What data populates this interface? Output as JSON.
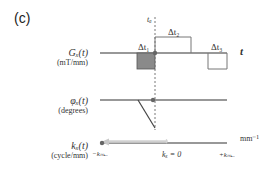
{
  "panel": {
    "label": "(c)"
  },
  "rows": {
    "gradient": {
      "label": "Gₓ(t)",
      "unit": "(mT/mm)"
    },
    "phase": {
      "label": "φₓ(t)",
      "unit": "(degrees)"
    },
    "kspace": {
      "label": "kₓ(t)",
      "unit": "(cycle/mm)"
    }
  },
  "annotations": {
    "t_a": "tₐ",
    "dt1": "Δt₁",
    "dt2": "Δt₂",
    "dt3": "Δt₃",
    "time_axis": "t",
    "k_unit": "mm⁻¹",
    "k_min_neg": "−kₘₐₓ",
    "k_zero": "kₓ = 0",
    "k_max_pos": "+kₘₐₓ"
  },
  "colors": {
    "line": "#333333",
    "lobe_fill": "#8a8a8a",
    "box_stroke": "#777777",
    "dashed": "#555555",
    "arrow": "#d0d0d0",
    "dot": "#666666"
  }
}
